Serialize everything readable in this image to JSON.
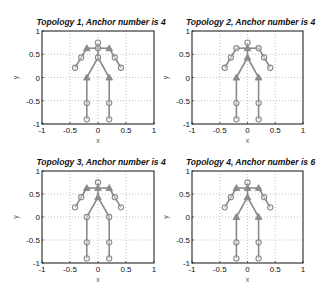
{
  "chart_data": [
    {
      "type": "scatter",
      "title": "Topology 1, Anchor number is 4",
      "xlabel": "x",
      "ylabel": "y",
      "xlim": [
        -1,
        1
      ],
      "ylim": [
        -1,
        1
      ],
      "xticks": [
        "-1",
        "-0.5",
        "0",
        "0.5",
        "1"
      ],
      "yticks": [
        "1",
        "0.5",
        "0",
        "-0.5",
        "-1"
      ],
      "grid": true,
      "anchor_count": 4,
      "anchors": [
        "shoulder_l",
        "shoulder_r",
        "hip_l",
        "hip_r"
      ]
    },
    {
      "type": "scatter",
      "title": "Topology 2, Anchor number is 4",
      "xlabel": "x",
      "ylabel": "y",
      "xlim": [
        -1,
        1
      ],
      "ylim": [
        -1,
        1
      ],
      "xticks": [
        "-1",
        "-0.5",
        "0",
        "0.5",
        "1"
      ],
      "yticks": [
        "1",
        "0.5",
        "0",
        "-0.5",
        "-1"
      ],
      "grid": true,
      "anchor_count": 4,
      "anchors": [
        "neck",
        "chest",
        "hip_l",
        "hip_r"
      ]
    },
    {
      "type": "scatter",
      "title": "Topology 3, Anchor number is 4",
      "xlabel": "x",
      "ylabel": "y",
      "xlim": [
        -1,
        1
      ],
      "ylim": [
        -1,
        1
      ],
      "xticks": [
        "-1",
        "-0.5",
        "0",
        "0.5",
        "1"
      ],
      "yticks": [
        "1",
        "0.5",
        "0",
        "-0.5",
        "-1"
      ],
      "grid": true,
      "anchor_count": 4,
      "anchors": [
        "shoulder_l",
        "shoulder_r",
        "neck",
        "chest"
      ]
    },
    {
      "type": "scatter",
      "title": "Topology 4, Anchor number is 6",
      "xlabel": "x",
      "ylabel": "y",
      "xlim": [
        -1,
        1
      ],
      "ylim": [
        -1,
        1
      ],
      "xticks": [
        "-1",
        "-0.5",
        "0",
        "0.5",
        "1"
      ],
      "yticks": [
        "1",
        "0.5",
        "0",
        "-0.5",
        "-1"
      ],
      "grid": true,
      "anchor_count": 6,
      "anchors": [
        "shoulder_l",
        "shoulder_r",
        "neck",
        "chest",
        "hip_l",
        "hip_r"
      ]
    }
  ],
  "skeleton": {
    "nodes": {
      "head": [
        0,
        0.75
      ],
      "neck": [
        0,
        0.63
      ],
      "shoulder_l": [
        -0.2,
        0.63
      ],
      "shoulder_r": [
        0.2,
        0.63
      ],
      "elbow_l": [
        -0.3,
        0.43
      ],
      "elbow_r": [
        0.3,
        0.43
      ],
      "hand_l": [
        -0.41,
        0.21
      ],
      "hand_r": [
        0.41,
        0.21
      ],
      "chest": [
        0,
        0.43
      ],
      "hip_l": [
        -0.2,
        0.0
      ],
      "hip_r": [
        0.2,
        0.0
      ],
      "knee_l": [
        -0.2,
        -0.55
      ],
      "knee_r": [
        0.2,
        -0.55
      ],
      "foot_l": [
        -0.2,
        -0.9
      ],
      "foot_r": [
        0.2,
        -0.9
      ]
    },
    "edges": [
      [
        "head",
        "neck"
      ],
      [
        "neck",
        "shoulder_l"
      ],
      [
        "neck",
        "shoulder_r"
      ],
      [
        "shoulder_l",
        "elbow_l"
      ],
      [
        "elbow_l",
        "hand_l"
      ],
      [
        "shoulder_r",
        "elbow_r"
      ],
      [
        "elbow_r",
        "hand_r"
      ],
      [
        "neck",
        "chest"
      ],
      [
        "chest",
        "hip_l"
      ],
      [
        "chest",
        "hip_r"
      ],
      [
        "hip_l",
        "knee_l"
      ],
      [
        "knee_l",
        "foot_l"
      ],
      [
        "hip_r",
        "knee_r"
      ],
      [
        "knee_r",
        "foot_r"
      ]
    ]
  },
  "colors": {
    "skeleton": "#8a8a8a",
    "grid": "#9a9a9a",
    "axes": "#111111"
  }
}
